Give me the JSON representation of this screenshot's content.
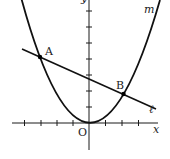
{
  "figure": {
    "type": "coordinate-geometry-diagram",
    "axes": {
      "x_label": "x",
      "y_label": "y",
      "origin_label": "O",
      "x_ticks": [
        -4,
        -3,
        -2,
        -1,
        1,
        2,
        3
      ],
      "y_ticks": [
        1,
        2,
        3,
        4,
        5,
        6,
        7
      ]
    },
    "curves": {
      "parabola": {
        "label": "m",
        "equation_form": "y = a x^2",
        "vertex": "O"
      },
      "line": {
        "label": "ℓ"
      }
    },
    "points": [
      {
        "id": "A",
        "label": "A",
        "x": -3
      },
      {
        "id": "B",
        "label": "B",
        "x": 2
      }
    ],
    "colors": {
      "ink": "#111111",
      "background": "#ffffff"
    }
  }
}
